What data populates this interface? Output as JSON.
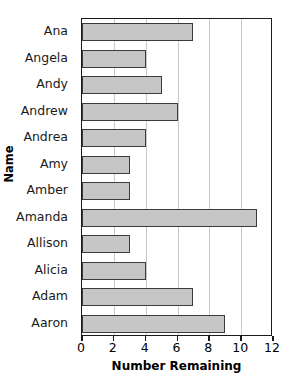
{
  "chart_data": {
    "type": "bar",
    "orientation": "horizontal",
    "title": "",
    "xlabel": "Number Remaining",
    "ylabel": "Name",
    "categories": [
      "Ana",
      "Angela",
      "Andy",
      "Andrew",
      "Andrea",
      "Amy",
      "Amber",
      "Amanda",
      "Allison",
      "Alicia",
      "Adam",
      "Aaron"
    ],
    "values": [
      7,
      4,
      5,
      6,
      4,
      3,
      3,
      11,
      3,
      4,
      7,
      9
    ],
    "xlim": [
      0,
      12
    ],
    "xticks": [
      0,
      2,
      4,
      6,
      8,
      10,
      12
    ],
    "xtick_labels": [
      "0",
      "2",
      "4",
      "6",
      "8",
      "10",
      "12"
    ],
    "grid": "vertical",
    "legend": "none",
    "bar_fill": "#c6c6c6",
    "bar_border": "#3b3b3b",
    "gridline_color": "#c9c9c9",
    "axis_color": "#1a1a1a"
  }
}
